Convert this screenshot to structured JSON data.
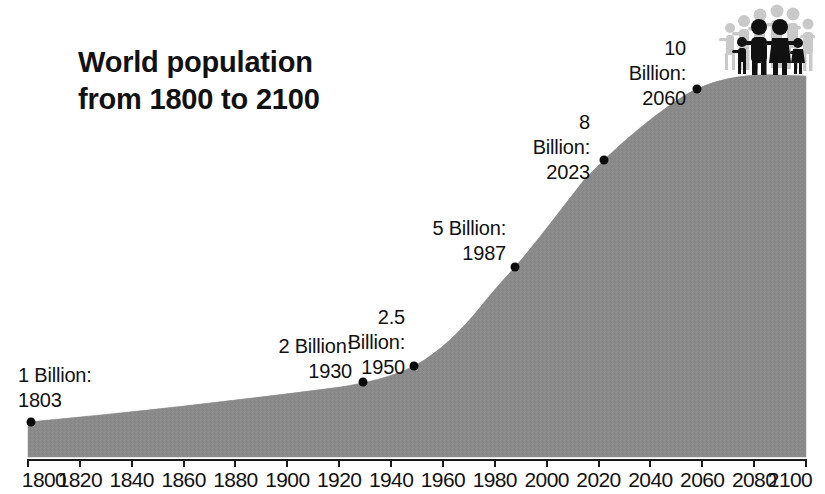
{
  "title": {
    "line1": "World population",
    "line2": "from 1800 to 2100",
    "full": "World population\nfrom 1800 to 2100"
  },
  "icons": {
    "people_group": "people-group-icon"
  },
  "axis": {
    "tick_labels": [
      "1800",
      "1820",
      "1840",
      "1860",
      "1880",
      "1900",
      "1920",
      "1940",
      "1960",
      "1980",
      "2000",
      "2020",
      "2040",
      "2060",
      "2080",
      "2100"
    ]
  },
  "annotations": [
    {
      "label": "1 Billion:",
      "year": "1803",
      "text": "1 Billion:\n1803"
    },
    {
      "label": "2 Billion:",
      "year": "1930",
      "text": "2 Billion:\n1930"
    },
    {
      "label": "2.5 Billion:",
      "year": "1950",
      "text": "2.5 Billion:\n1950"
    },
    {
      "label": "5 Billion:",
      "year": "1987",
      "text": "5 Billion:\n1987"
    },
    {
      "label": "8 Billion:",
      "year": "2023",
      "text": "8 Billion:\n2023"
    },
    {
      "label": "10 Billion:",
      "year": "2060",
      "text": "10 Billion:\n2060"
    }
  ],
  "colors": {
    "area_fill": "#8a8a8a",
    "area_fill_dark": "#7b7b7b",
    "text": "#111111",
    "marker": "#0b0b0b",
    "axis": "#1a1a1a",
    "people_front": "#111111",
    "people_back": "#c9c9c9",
    "background": "#ffffff"
  },
  "chart_data": {
    "type": "area",
    "title": "World population from 1800 to 2100",
    "xlabel": "",
    "ylabel": "",
    "xlim": [
      1800,
      2100
    ],
    "ylim": [
      0,
      11.5
    ],
    "grid": false,
    "legend": null,
    "x_tick_step": 20,
    "x_ticks": [
      1800,
      1820,
      1840,
      1860,
      1880,
      1900,
      1920,
      1940,
      1960,
      1980,
      2000,
      2020,
      2040,
      2060,
      2080,
      2100
    ],
    "units": "Billions of people",
    "series": [
      {
        "name": "World population",
        "x": [
          1800,
          1820,
          1840,
          1860,
          1880,
          1900,
          1920,
          1930,
          1940,
          1950,
          1960,
          1970,
          1980,
          1987,
          1990,
          2000,
          2010,
          2023,
          2030,
          2040,
          2050,
          2060,
          2070,
          2080,
          2090,
          2100
        ],
        "values": [
          0.98,
          1.04,
          1.15,
          1.26,
          1.4,
          1.6,
          1.86,
          2.0,
          2.3,
          2.5,
          3.03,
          3.7,
          4.43,
          5.0,
          5.28,
          6.14,
          6.96,
          8.0,
          8.5,
          9.2,
          9.7,
          10.0,
          10.2,
          10.35,
          10.4,
          10.45
        ]
      }
    ],
    "annotated_points": [
      {
        "year": 1803,
        "population_billions": 1,
        "label": "1 Billion: 1803"
      },
      {
        "year": 1930,
        "population_billions": 2,
        "label": "2 Billion: 1930"
      },
      {
        "year": 1950,
        "population_billions": 2.5,
        "label": "2.5 Billion: 1950"
      },
      {
        "year": 1987,
        "population_billions": 5,
        "label": "5 Billion: 1987"
      },
      {
        "year": 2023,
        "population_billions": 8,
        "label": "8 Billion: 2023"
      },
      {
        "year": 2060,
        "population_billions": 10,
        "label": "10 Billion: 2060"
      }
    ]
  }
}
